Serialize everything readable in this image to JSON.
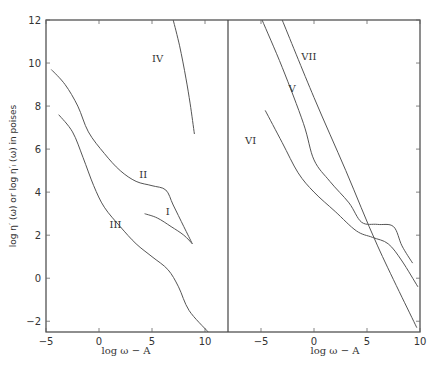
{
  "chart_data": {
    "type": "line",
    "ylabel": "log η′ (ω) or log η′ₗ (ω) in poises",
    "ylim": [
      -2.5,
      12
    ],
    "yticks": [
      -2,
      0,
      2,
      4,
      6,
      8,
      10,
      12
    ],
    "panels": [
      {
        "name": "left",
        "xlabel": "log ω − A",
        "xlim": [
          -5,
          12.2
        ],
        "xticks": [
          -5,
          0,
          5,
          10
        ],
        "series": [
          {
            "name": "IV",
            "label_at": [
              5.0,
              10.2
            ],
            "points": [
              [
                7.0,
                12.0
              ],
              [
                7.6,
                10.8
              ],
              [
                8.2,
                9.3
              ],
              [
                8.6,
                8.1
              ],
              [
                9.0,
                6.7
              ]
            ]
          },
          {
            "name": "II",
            "label_at": [
              3.8,
              4.8
            ],
            "points": [
              [
                -4.5,
                9.7
              ],
              [
                -3.2,
                9.0
              ],
              [
                -2.0,
                8.0
              ],
              [
                -1.0,
                6.8
              ],
              [
                0.5,
                5.8
              ],
              [
                2.0,
                5.0
              ],
              [
                3.5,
                4.5
              ],
              [
                5.0,
                4.3
              ],
              [
                6.3,
                4.1
              ],
              [
                7.0,
                3.4
              ],
              [
                8.0,
                2.4
              ],
              [
                8.8,
                1.6
              ]
            ]
          },
          {
            "name": "III",
            "label_at": [
              1.0,
              2.5
            ],
            "points": [
              [
                -3.8,
                7.6
              ],
              [
                -2.5,
                6.8
              ],
              [
                -1.5,
                5.6
              ],
              [
                -0.5,
                4.3
              ],
              [
                0.5,
                3.3
              ],
              [
                2.0,
                2.4
              ],
              [
                3.5,
                1.6
              ],
              [
                5.0,
                1.0
              ],
              [
                6.5,
                0.4
              ],
              [
                7.5,
                -0.4
              ],
              [
                8.5,
                -1.5
              ],
              [
                10.3,
                -2.5
              ]
            ]
          },
          {
            "name": "I",
            "label_at": [
              6.3,
              3.1
            ],
            "points": [
              [
                4.3,
                3.0
              ],
              [
                5.5,
                2.8
              ],
              [
                6.8,
                2.4
              ],
              [
                8.0,
                2.0
              ],
              [
                8.8,
                1.6
              ]
            ]
          }
        ]
      },
      {
        "name": "right",
        "xlabel": "log ω − A",
        "xlim": [
          -7,
          10
        ],
        "xticks": [
          -5,
          0,
          5,
          10
        ],
        "series": [
          {
            "name": "VII",
            "label_at": [
              -1.2,
              10.3
            ],
            "points": [
              [
                -3.0,
                12.0
              ],
              [
                0.0,
                8.4
              ],
              [
                3.0,
                5.0
              ],
              [
                6.0,
                1.5
              ],
              [
                9.7,
                -2.3
              ]
            ]
          },
          {
            "name": "V",
            "label_at": [
              -2.4,
              8.8
            ],
            "points": [
              [
                -4.9,
                12.0
              ],
              [
                -3.0,
                9.8
              ],
              [
                -1.0,
                7.2
              ],
              [
                0.0,
                5.5
              ],
              [
                1.5,
                4.5
              ],
              [
                3.3,
                3.5
              ],
              [
                4.5,
                2.6
              ],
              [
                6.0,
                2.5
              ],
              [
                7.5,
                2.4
              ],
              [
                8.3,
                1.5
              ],
              [
                9.3,
                0.7
              ]
            ]
          },
          {
            "name": "VI",
            "label_at": [
              -6.5,
              6.4
            ],
            "points": [
              [
                -4.6,
                7.8
              ],
              [
                -3.0,
                6.3
              ],
              [
                -1.5,
                4.9
              ],
              [
                0.0,
                4.0
              ],
              [
                2.0,
                3.1
              ],
              [
                4.0,
                2.2
              ],
              [
                5.5,
                1.9
              ],
              [
                7.0,
                1.6
              ],
              [
                8.3,
                0.8
              ],
              [
                9.8,
                -0.4
              ]
            ]
          }
        ]
      }
    ]
  }
}
